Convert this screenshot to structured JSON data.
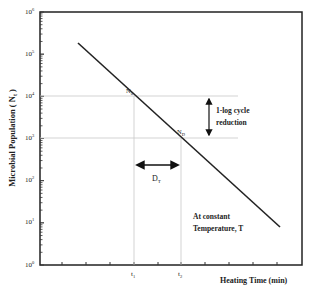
{
  "chart_data": {
    "type": "line",
    "title": "",
    "xlabel": "Heating Time (min)",
    "ylabel": "Microbial Population ( N",
    "ylabel_sub": "t",
    "ylabel_end": " )",
    "yscale": "log",
    "ylim": [
      1,
      1000000
    ],
    "y_ticks": [
      {
        "base": "10",
        "exp": "6"
      },
      {
        "base": "10",
        "exp": "5"
      },
      {
        "base": "10",
        "exp": "4"
      },
      {
        "base": "10",
        "exp": "3"
      },
      {
        "base": "10",
        "exp": "2"
      },
      {
        "base": "10",
        "exp": "1"
      },
      {
        "base": "10",
        "exp": "0"
      }
    ],
    "x_tick_labels": {
      "t1": {
        "base": "t",
        "sub": "1"
      },
      "t2": {
        "base": "t",
        "sub": "2"
      }
    },
    "series": [
      {
        "name": "Survivor curve",
        "points": [
          [
            0.5,
            250000
          ],
          [
            9,
            3
          ]
        ]
      }
    ],
    "annotations": {
      "n0": {
        "base": "N",
        "sub": "0"
      },
      "nd": {
        "base": "N",
        "sub": "D"
      },
      "log_reduction": [
        "1-log cycle",
        "reduction"
      ],
      "dt": {
        "base": "D",
        "sub": "T"
      },
      "condition": [
        "At constant",
        "Temperature, T"
      ]
    },
    "grid": false
  }
}
